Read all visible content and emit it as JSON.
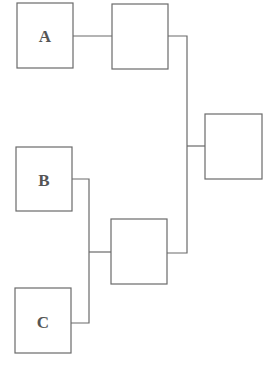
{
  "diagram": {
    "type": "bracket-tree",
    "leaves": [
      {
        "id": "a",
        "label": "A"
      },
      {
        "id": "b",
        "label": "B"
      },
      {
        "id": "c",
        "label": "C"
      }
    ],
    "intermediate": [
      {
        "id": "mid-top",
        "label": "",
        "children": [
          "a"
        ]
      },
      {
        "id": "mid-bottom",
        "label": "",
        "children": [
          "b",
          "c"
        ]
      }
    ],
    "root": {
      "id": "final",
      "label": "",
      "children": [
        "mid-top",
        "mid-bottom"
      ]
    }
  }
}
